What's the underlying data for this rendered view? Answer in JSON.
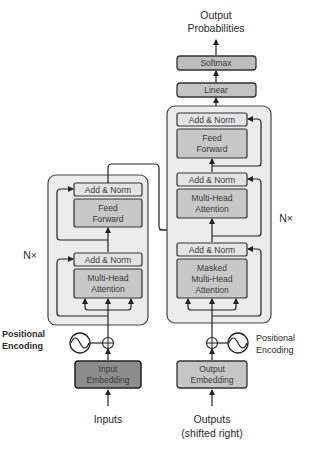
{
  "colors": {
    "outer_block": "#ececec",
    "add_norm": "#e4e4e4",
    "sublayer": "#c8c8c8",
    "input_embedding": "#8c8c8c",
    "output_embedding": "#c6c6c6",
    "softmax": "#bdbdbd",
    "linear": "#c4c4c4",
    "stroke": "#333333"
  },
  "output": {
    "title_line1": "Output",
    "title_line2": "Probabilities",
    "softmax": "Softmax",
    "linear": "Linear"
  },
  "encoder": {
    "repeat_label": "N×",
    "add_norm_top": "Add & Norm",
    "feed_forward_line1": "Feed",
    "feed_forward_line2": "Forward",
    "add_norm_bottom": "Add & Norm",
    "attention_line1": "Multi-Head",
    "attention_line2": "Attention",
    "positional_line1": "Positional",
    "positional_line2": "Encoding",
    "embedding_line1": "Input",
    "embedding_line2": "Embedding",
    "input_label": "Inputs"
  },
  "decoder": {
    "repeat_label": "N×",
    "add_norm_top": "Add & Norm",
    "feed_forward_line1": "Feed",
    "feed_forward_line2": "Forward",
    "add_norm_mid": "Add & Norm",
    "attention_line1": "Multi-Head",
    "attention_line2": "Attention",
    "add_norm_bottom": "Add & Norm",
    "masked_line1": "Masked",
    "masked_line2": "Multi-Head",
    "masked_line3": "Attention",
    "positional_line1": "Positional",
    "positional_line2": "Encoding",
    "embedding_line1": "Output",
    "embedding_line2": "Embedding",
    "output_label_line1": "Outputs",
    "output_label_line2": "(shifted right)"
  }
}
